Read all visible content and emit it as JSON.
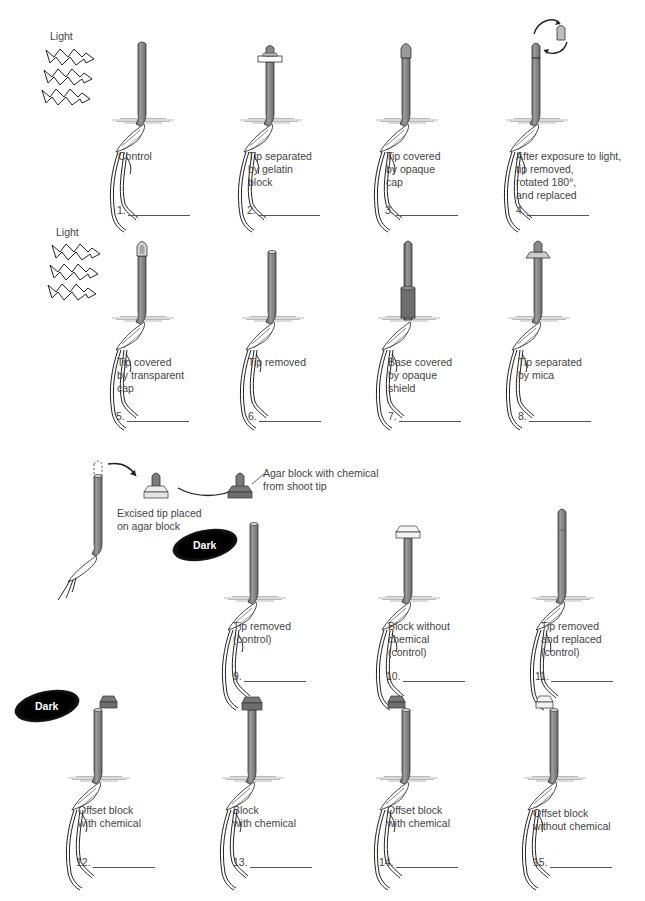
{
  "diagram": {
    "light_labels": [
      "Light",
      "Light"
    ],
    "dark_labels": [
      "Dark",
      "Dark"
    ],
    "colors": {
      "coleoptile": "#8a8a8a",
      "coleoptile_dark": "#5a5a5a",
      "block_with_chemical": "#6e6e6e",
      "block_without_chemical": "#f2f2f2",
      "cap_opaque": "#9a9a9a",
      "cap_transparent": "#d8d8d8"
    },
    "agar_procedure": {
      "step1_caption": "Excised tip placed\non agar block",
      "step2_caption": "Agar block with chemical\nfrom shoot tip"
    },
    "experiments": [
      {
        "number": "1.",
        "caption": "Control",
        "answer": ""
      },
      {
        "number": "2.",
        "caption": "Tip separated\nby gelatin\nblock",
        "answer": ""
      },
      {
        "number": "3.",
        "caption": "Tip covered\nby opaque\ncap",
        "answer": ""
      },
      {
        "number": "4.",
        "caption": "After exposure to light,\ntip removed,\nrotated 180°,\nand replaced",
        "answer": ""
      },
      {
        "number": "5.",
        "caption": "Tip covered\nby transparent\ncap",
        "answer": ""
      },
      {
        "number": "6.",
        "caption": "Tip removed",
        "answer": ""
      },
      {
        "number": "7.",
        "caption": "Base covered\nby opaque\nshield",
        "answer": ""
      },
      {
        "number": "8.",
        "caption": "Tip separated\nby mica",
        "answer": ""
      },
      {
        "number": "9.",
        "caption": "Tip removed\n(control)",
        "answer": ""
      },
      {
        "number": "10.",
        "caption": "Block without\nchemical\n(control)",
        "answer": ""
      },
      {
        "number": "11.",
        "caption": "Tip removed\nand replaced\n(control)",
        "answer": ""
      },
      {
        "number": "12.",
        "caption": "Offset block\nwith chemical",
        "answer": ""
      },
      {
        "number": "13.",
        "caption": "Block\nwith chemical",
        "answer": ""
      },
      {
        "number": "14.",
        "caption": "Offset block\nwith chemical",
        "answer": ""
      },
      {
        "number": "15.",
        "caption": "Offset block\nwithout chemical",
        "answer": ""
      }
    ]
  }
}
